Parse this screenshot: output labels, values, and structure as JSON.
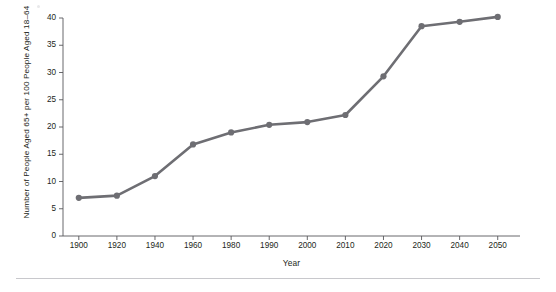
{
  "chart_data": {
    "type": "line",
    "title": "",
    "xlabel": "Year",
    "ylabel": "Number of People Aged 65+ per 100 People Aged 18–64",
    "categories": [
      "1900",
      "1920",
      "1940",
      "1960",
      "1980",
      "1990",
      "2000",
      "2010",
      "2020",
      "2030",
      "2040",
      "2050"
    ],
    "values": [
      7.0,
      7.4,
      11.0,
      16.8,
      19.0,
      20.4,
      20.9,
      22.2,
      29.3,
      38.5,
      39.3,
      40.2
    ],
    "series": [
      {
        "name": "Old-age dependency ratio",
        "values": [
          7.0,
          7.4,
          11.0,
          16.8,
          19.0,
          20.4,
          20.9,
          22.2,
          29.3,
          38.5,
          39.3,
          40.2
        ]
      }
    ],
    "ylim": [
      0,
      40
    ],
    "yticks": [
      0,
      5,
      10,
      15,
      20,
      25,
      30,
      35,
      40
    ],
    "ytick_labels": [
      "0",
      "5",
      "10",
      "15",
      "20",
      "25",
      "30",
      "35",
      "40"
    ],
    "xtick_labels": [
      "1900",
      "1920",
      "1940",
      "1960",
      "1980",
      "1990",
      "2000",
      "2010",
      "2020",
      "2030",
      "2040",
      "2050"
    ],
    "grid": false,
    "legend": "none",
    "marker": "circle",
    "line_color": "#6e6e73",
    "marker_color": "#6e6e73",
    "axis_color": "#58585b",
    "text_color": "#231f20",
    "background": "#ffffff",
    "annotations": []
  },
  "figure": {
    "x_axis_title": "Year",
    "y_axis_title": "Number of People Aged 65+ per 100 People Aged 18–64"
  }
}
